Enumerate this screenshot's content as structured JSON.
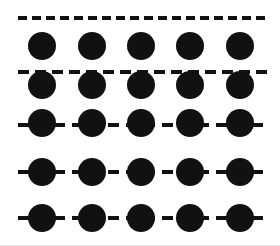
{
  "figure": {
    "width": 280,
    "height": 246,
    "background_color": "#ffffff",
    "ink_color": "#111111",
    "bottom_rule_color": "#e3e3e3",
    "circle": {
      "count_per_row": 5,
      "diameter": 28,
      "fill_color": "#111111",
      "centers_x": [
        42,
        92,
        141,
        190,
        240
      ]
    },
    "rows": [
      {
        "id": "row-1",
        "label": "row 1",
        "line_y": 18,
        "circles_center_y": 46,
        "line_x_start": 18,
        "line_x_end": 268,
        "line_thickness": 4,
        "dash_length": 9,
        "dash_gap": 5,
        "circles_offset_from_line": 28,
        "relation": "circles fully below the dashed line"
      },
      {
        "id": "row-2",
        "label": "row 2",
        "line_y": 72,
        "circles_center_y": 85,
        "line_x_start": 18,
        "line_x_end": 268,
        "line_thickness": 4,
        "dash_length": 11,
        "dash_gap": 6,
        "circles_offset_from_line": 13,
        "relation": "dashed line crosses the upper edge of the circles"
      },
      {
        "id": "row-3",
        "label": "row 3",
        "line_y": 125,
        "circles_center_y": 123,
        "line_x_start": 18,
        "line_x_end": 268,
        "line_thickness": 4,
        "dash_length": 11,
        "dash_gap": 7,
        "circles_offset_from_line": -2,
        "relation": "dashed line passes near the centers of the circles"
      },
      {
        "id": "row-4",
        "label": "row 4",
        "line_y": 172,
        "circles_center_y": 172,
        "line_x_start": 18,
        "line_x_end": 268,
        "line_thickness": 4,
        "dash_length": 11,
        "dash_gap": 7,
        "circles_offset_from_line": 0,
        "relation": "dashed line passes through the centers of the circles"
      },
      {
        "id": "row-5",
        "label": "row 5",
        "line_y": 218,
        "circles_center_y": 218,
        "line_x_start": 18,
        "line_x_end": 268,
        "line_thickness": 4,
        "dash_length": 11,
        "dash_gap": 7,
        "circles_offset_from_line": 0,
        "relation": "dashed line passes through the centers of the circles"
      }
    ]
  }
}
